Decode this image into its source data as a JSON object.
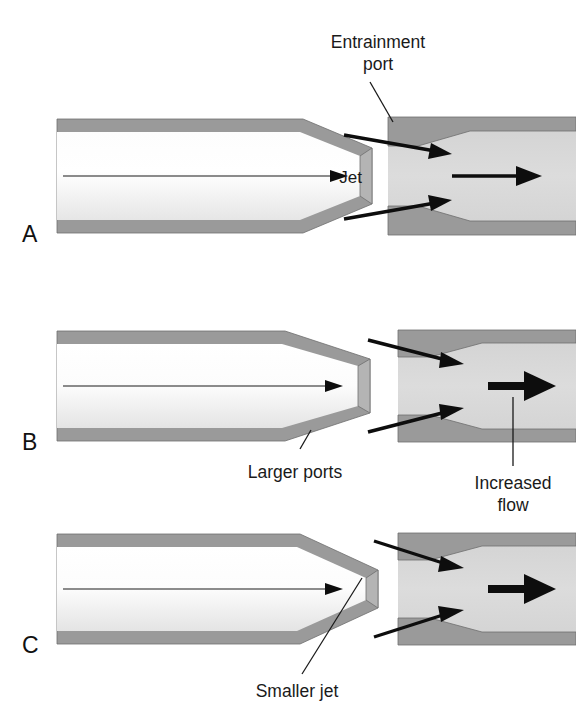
{
  "figure": {
    "background_color": "#ffffff",
    "wall_color": "#9a9a9a",
    "chamber_color": "#d6d6d6",
    "bore_color": "#f2f2f2",
    "arrow_color": "#0d0d0d",
    "text_color": "#1a1a1a"
  },
  "annotations": {
    "entrainment_port_line1": "Entrainment",
    "entrainment_port_line2": "port",
    "jet": "Jet",
    "larger_ports": "Larger ports",
    "increased_flow_line1": "Increased",
    "increased_flow_line2": "flow",
    "smaller_jet": "Smaller jet"
  },
  "panels": [
    {
      "letter": "A",
      "description": "Baseline jet with standard entrainment port and standard outflow",
      "jet_label": "Jet",
      "port_size": "standard",
      "jet_size": "standard",
      "outflow": "standard"
    },
    {
      "letter": "B",
      "description": "Larger entrainment ports produce increased flow",
      "port_size": "larger",
      "jet_size": "standard",
      "outflow": "increased"
    },
    {
      "letter": "C",
      "description": "Smaller jet orifice with larger ports produces increased flow",
      "port_size": "larger",
      "jet_size": "smaller",
      "outflow": "increased"
    }
  ]
}
